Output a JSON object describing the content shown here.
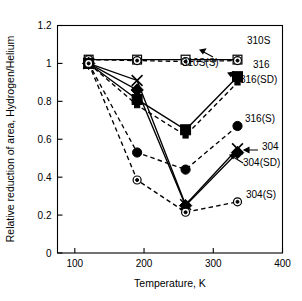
{
  "chart_data": {
    "type": "line",
    "title": "",
    "xlabel": "Temperature, K",
    "ylabel": "Relative reduction of area, Hydrogen/Helium",
    "xlim": [
      75,
      400
    ],
    "ylim": [
      0,
      1.2
    ],
    "xticks": [
      100,
      200,
      300,
      400
    ],
    "xtick_labels": [
      "100",
      "200",
      "300",
      "400"
    ],
    "yticks": [
      0,
      0.2,
      0.4,
      0.6,
      0.8,
      1,
      1.2
    ],
    "ytick_labels": [
      "0",
      "0.2",
      "0.4",
      "0.6",
      "0.8",
      "1",
      "1.2"
    ],
    "grid": false,
    "legend_position": "right-inline-annotations",
    "series": [
      {
        "name": "310S",
        "marker": "open-square",
        "line": "solid",
        "x": [
          120,
          190,
          260,
          335
        ],
        "y": [
          1.02,
          1.02,
          1.02,
          1.02
        ]
      },
      {
        "name": "310S(S)",
        "marker": "circled-dot",
        "line": "dashed",
        "x": [
          120,
          190,
          260,
          335
        ],
        "y": [
          1.02,
          1.015,
          1.01,
          1.015
        ]
      },
      {
        "name": "316",
        "marker": "filled-square",
        "line": "solid",
        "x": [
          120,
          190,
          260,
          335
        ],
        "y": [
          1.0,
          0.81,
          0.65,
          0.93
        ]
      },
      {
        "name": "316(SD)",
        "marker": "filled-square-small",
        "line": "dashed",
        "x": [
          120,
          190,
          260,
          335
        ],
        "y": [
          1.0,
          0.78,
          0.62,
          0.9
        ]
      },
      {
        "name": "316(S)",
        "marker": "filled-circle",
        "line": "dashed",
        "x": [
          120,
          190,
          260,
          335
        ],
        "y": [
          1.0,
          0.53,
          0.44,
          0.67
        ]
      },
      {
        "name": "304",
        "marker": "cross",
        "line": "solid",
        "x": [
          120,
          190,
          260,
          335
        ],
        "y": [
          1.0,
          0.91,
          0.255,
          0.55
        ]
      },
      {
        "name": "304(SD)",
        "marker": "filled-diamond",
        "line": "solid",
        "x": [
          120,
          190,
          260,
          335
        ],
        "y": [
          1.0,
          0.86,
          0.25,
          0.53
        ]
      },
      {
        "name": "304(S)",
        "marker": "circled-dot",
        "line": "dashed",
        "x": [
          120,
          190,
          260,
          335
        ],
        "y": [
          1.0,
          0.385,
          0.215,
          0.27
        ]
      }
    ],
    "annotations": [
      {
        "label": "310S",
        "x": 247,
        "y": 44
      },
      {
        "label": "310S(S)",
        "x": 182,
        "y": 66
      },
      {
        "label": "316",
        "x": 253,
        "y": 68
      },
      {
        "label": "316(SD)",
        "x": 240,
        "y": 83
      },
      {
        "label": "316(S)",
        "x": 245,
        "y": 122
      },
      {
        "label": "304",
        "x": 262,
        "y": 150
      },
      {
        "label": "304(SD)",
        "x": 243,
        "y": 166
      },
      {
        "label": "304(S)",
        "x": 246,
        "y": 198
      }
    ]
  }
}
